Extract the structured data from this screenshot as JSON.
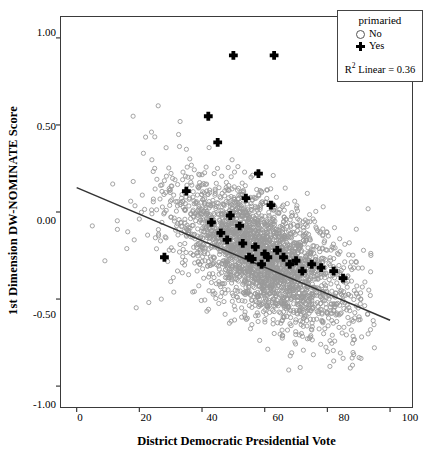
{
  "chart_data": {
    "type": "scatter",
    "title": "",
    "xlabel": "District Democratic Presidential Vote",
    "ylabel": "1st Dimension DW-NOMINATE Score",
    "xlim": [
      -5,
      107
    ],
    "ylim": [
      -1.12,
      1.12
    ],
    "xticks": [
      0,
      20,
      40,
      60,
      80,
      100
    ],
    "xticklabels": [
      "0",
      "20",
      "40",
      "60",
      "80",
      "100"
    ],
    "yticks": [
      1.0,
      0.5,
      0.0,
      -0.5,
      -1.0
    ],
    "yticklabels": [
      "1.00",
      "0.50",
      "0.00",
      "-0.50",
      "-1.00"
    ],
    "grid": false,
    "legend": {
      "title": "primaried",
      "position": "top-right",
      "entries": [
        {
          "label": "No",
          "marker": "open-circle",
          "color": "#8f8f8f"
        },
        {
          "label": "Yes",
          "marker": "plus",
          "color": "#000000"
        }
      ],
      "annotation_prefix": "R",
      "annotation_sup": "2",
      "annotation_text": "Linear = 0.36"
    },
    "fit_line": {
      "type": "linear",
      "r_squared": 0.36,
      "intercept": 0.14,
      "slope": -0.00762,
      "x_start": 0,
      "y_start": 0.14,
      "x_end": 100,
      "y_end": -0.622,
      "color": "#333333"
    },
    "series": [
      {
        "name": "No",
        "marker": "open-circle",
        "color": "#9a9a9a",
        "n_points": 2600,
        "description": "Dense gray open-circle cloud of non-primaried legislators, centered near x=60, y=-0.25, elongated along the negative-slope regression trend.",
        "cloud": {
          "x_center": 60,
          "y_center": -0.26,
          "x_spread": 14,
          "y_spread": 0.17,
          "tilt_slope": -0.009,
          "x_min": 5,
          "x_max": 95,
          "y_min": -0.92,
          "y_max": 0.78
        },
        "outliers_x": [
          5,
          9,
          13,
          16,
          18,
          20,
          22,
          24,
          26,
          28,
          30,
          33,
          35,
          27,
          31,
          23,
          19,
          90,
          93,
          95,
          88,
          85
        ],
        "outliers_y": [
          -0.08,
          -0.28,
          -0.1,
          -0.21,
          0.55,
          -0.04,
          0.43,
          0.3,
          0.61,
          0.18,
          -0.4,
          0.52,
          0.36,
          -0.5,
          -0.46,
          -0.52,
          -0.55,
          -0.62,
          -0.7,
          -0.78,
          -0.88,
          -0.84
        ]
      },
      {
        "name": "Yes",
        "marker": "plus",
        "color": "#000000",
        "n_points": 30,
        "x": [
          50,
          63,
          42,
          45,
          35,
          54,
          58,
          62,
          49,
          52,
          46,
          53,
          57,
          60,
          61,
          64,
          66,
          68,
          70,
          72,
          75,
          78,
          82,
          85,
          43,
          48,
          55,
          56,
          59,
          28
        ],
        "y": [
          0.9,
          0.9,
          0.55,
          0.4,
          0.12,
          0.08,
          0.22,
          0.04,
          -0.02,
          -0.08,
          -0.12,
          -0.18,
          -0.2,
          -0.24,
          -0.26,
          -0.22,
          -0.26,
          -0.3,
          -0.28,
          -0.34,
          -0.3,
          -0.32,
          -0.34,
          -0.38,
          -0.06,
          -0.16,
          -0.26,
          -0.27,
          -0.3,
          -0.26
        ]
      }
    ]
  }
}
